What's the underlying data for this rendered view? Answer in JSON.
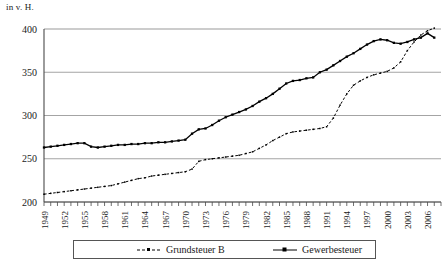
{
  "axis_unit_label": "in v. H.",
  "legend": {
    "items": [
      {
        "label": "Grundsteuer B",
        "style": "dashed",
        "color": "#000000",
        "marker": "square-small"
      },
      {
        "label": "Gewerbesteuer",
        "style": "solid",
        "color": "#000000",
        "marker": "square"
      }
    ]
  },
  "chart_data": {
    "type": "line",
    "title": "",
    "subtitle": "",
    "xlabel": "",
    "ylabel": "in v. H.",
    "ylim": [
      200,
      400
    ],
    "xlim": [
      1949,
      2008
    ],
    "yticks": [
      200,
      250,
      300,
      350,
      400
    ],
    "xticks": [
      1949,
      1952,
      1955,
      1958,
      1961,
      1964,
      1967,
      1970,
      1973,
      1976,
      1979,
      1982,
      1985,
      1988,
      1991,
      1994,
      1997,
      2000,
      2003,
      2006
    ],
    "x": [
      1949,
      1950,
      1951,
      1952,
      1953,
      1954,
      1955,
      1956,
      1957,
      1958,
      1959,
      1960,
      1961,
      1962,
      1963,
      1964,
      1965,
      1966,
      1967,
      1968,
      1969,
      1970,
      1971,
      1972,
      1973,
      1974,
      1975,
      1976,
      1977,
      1978,
      1979,
      1980,
      1981,
      1982,
      1983,
      1984,
      1985,
      1986,
      1987,
      1988,
      1989,
      1990,
      1991,
      1992,
      1993,
      1994,
      1995,
      1996,
      1997,
      1998,
      1999,
      2000,
      2001,
      2002,
      2003,
      2004,
      2005,
      2006,
      2007
    ],
    "grid": {
      "horizontal": true,
      "vertical": false
    },
    "legend_position": "bottom",
    "series": [
      {
        "name": "Grundsteuer B",
        "style": "dashed",
        "color": "#000000",
        "values": [
          209,
          210,
          211,
          212,
          213,
          214,
          215,
          216,
          217,
          218,
          219,
          221,
          223,
          225,
          227,
          228,
          230,
          231,
          232,
          233,
          234,
          235,
          238,
          247,
          249,
          250,
          251,
          252,
          253,
          254,
          256,
          258,
          262,
          266,
          271,
          275,
          279,
          281,
          282,
          283,
          284,
          285,
          287,
          297,
          312,
          325,
          335,
          340,
          344,
          347,
          349,
          351,
          355,
          362,
          375,
          385,
          393,
          398,
          401
        ]
      },
      {
        "name": "Gewerbesteuer",
        "style": "solid",
        "color": "#000000",
        "values": [
          263,
          264,
          265,
          266,
          267,
          268,
          268,
          264,
          263,
          264,
          265,
          266,
          266,
          267,
          267,
          268,
          268,
          269,
          269,
          270,
          271,
          272,
          279,
          284,
          285,
          289,
          294,
          298,
          301,
          304,
          307,
          311,
          316,
          320,
          325,
          331,
          337,
          340,
          341,
          343,
          344,
          350,
          353,
          358,
          363,
          368,
          372,
          377,
          382,
          386,
          388,
          387,
          384,
          383,
          385,
          388,
          390,
          395,
          390
        ]
      }
    ]
  }
}
